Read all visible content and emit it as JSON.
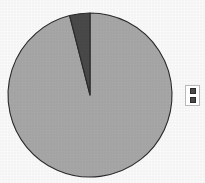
{
  "chart_data": {
    "type": "pie",
    "title": "",
    "subtitle": "",
    "xlabel": "",
    "ylabel": "",
    "grid": false,
    "legend_position": "right",
    "categories": [
      "Series 1",
      "Series 2"
    ],
    "values": [
      96,
      4
    ],
    "slices": [
      {
        "label": "Series 1",
        "value": 96,
        "color": "#a8a8a8",
        "start_angle_deg": 0,
        "end_angle_deg": 345.6
      },
      {
        "label": "Series 2",
        "value": 4,
        "color": "#4a4a4a",
        "start_angle_deg": 345.6,
        "end_angle_deg": 360
      }
    ],
    "center": {
      "x": 90,
      "y": 95
    },
    "radius": 82,
    "start_angle_deg": 0,
    "direction": "clockwise",
    "stroke_color": "#2b2b2b",
    "background": "#fbfbfb"
  },
  "legend": {
    "name": "chart-legend",
    "entries": [
      {
        "label": "",
        "color": "#4a4a4a",
        "swatch_name": "legend-swatch-series-1"
      },
      {
        "label": "",
        "color": "#4a4a4a",
        "swatch_name": "legend-swatch-series-2"
      }
    ]
  }
}
